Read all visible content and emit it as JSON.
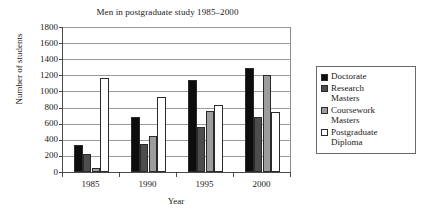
{
  "chart_data": {
    "type": "bar",
    "title": "Men in postgraduate study 1985–2000",
    "xlabel": "Year",
    "ylabel": "Number of students",
    "categories": [
      "1985",
      "1990",
      "1995",
      "2000"
    ],
    "series": [
      {
        "name": "Doctorate",
        "color": "#0d0d0d",
        "values": [
          340,
          680,
          1145,
          1295
        ]
      },
      {
        "name": "Research Masters",
        "color": "#4d4d4d",
        "values": [
          225,
          350,
          555,
          685
        ]
      },
      {
        "name": "Coursework Masters",
        "color": "#9d9d9d",
        "values": [
          50,
          445,
          760,
          1200
        ]
      },
      {
        "name": "Postgraduate Diploma",
        "color": "#ffffff",
        "values": [
          1170,
          935,
          835,
          750
        ]
      }
    ],
    "ylim": [
      0,
      1800
    ],
    "ytick_values": [
      0,
      200,
      400,
      600,
      800,
      1000,
      1200,
      1400,
      1600,
      1800
    ],
    "ytick_labels": [
      "0",
      "200",
      "400",
      "600",
      "800",
      "1000",
      "1200",
      "1400",
      "1600",
      "1800"
    ],
    "grid": true,
    "legend_position": "right",
    "legend_entries": [
      {
        "label_line1": "Doctorate",
        "label_line2": ""
      },
      {
        "label_line1": "Research",
        "label_line2": "Masters"
      },
      {
        "label_line1": "Coursework",
        "label_line2": "Masters"
      },
      {
        "label_line1": "Postgraduate",
        "label_line2": "Diploma"
      }
    ]
  }
}
